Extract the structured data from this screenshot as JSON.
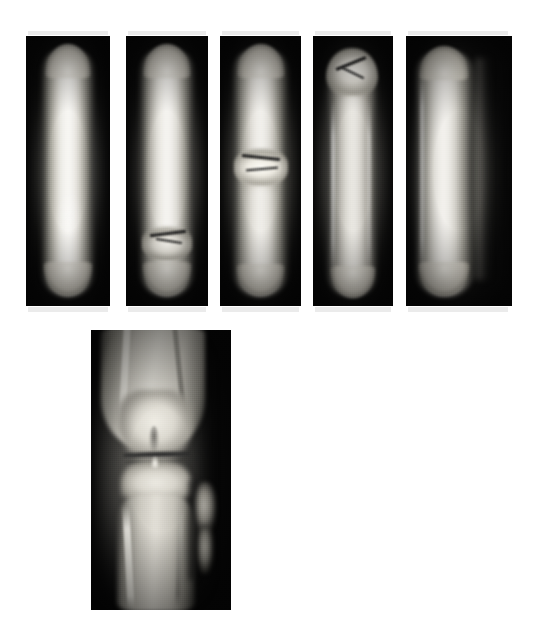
{
  "figure": {
    "kind": "radiograph-figure",
    "background_color": "#ffffff",
    "width": 547,
    "height": 630,
    "caption": "",
    "panel_count": 6
  },
  "series": {
    "label": "",
    "description": "Serial anteroposterior radiographs of a long bone (femoral / tibial diaphysis) showing progressive fracture healing, followed by an anteroposterior radiograph of the knee.",
    "row_top_label": "",
    "row_bottom_label": ""
  },
  "panels": [
    {
      "id": "panel-1",
      "label": "",
      "position": {
        "x": 26,
        "y": 36,
        "w": 84,
        "h": 270
      },
      "film_color": "#0a0a0a",
      "bone_color": "#e8e6e0",
      "view": "long-bone-ap",
      "finding": "intact diaphysis, no visible fracture line",
      "fracture": null
    },
    {
      "id": "panel-2",
      "label": "",
      "position": {
        "x": 126,
        "y": 36,
        "w": 82,
        "h": 270
      },
      "film_color": "#0a0a0a",
      "bone_color": "#e6e4de",
      "view": "long-bone-ap",
      "finding": "transverse fracture with early callus, distal third",
      "fracture": {
        "center_y_pct": 74,
        "type": "transverse"
      }
    },
    {
      "id": "panel-3",
      "label": "",
      "position": {
        "x": 220,
        "y": 36,
        "w": 81,
        "h": 270
      },
      "film_color": "#0a0a0a",
      "bone_color": "#ddd9d2",
      "view": "long-bone-ap",
      "finding": "fracture with callus formation at mid-diaphysis",
      "fracture": {
        "center_y_pct": 46,
        "type": "transverse"
      }
    },
    {
      "id": "panel-4",
      "label": "",
      "position": {
        "x": 313,
        "y": 36,
        "w": 80,
        "h": 270
      },
      "film_color": "#0a0a0a",
      "bone_color": "#d9d5ce",
      "view": "long-bone-ap",
      "finding": "fracture with bridging callus, proximal third",
      "fracture": {
        "center_y_pct": 17,
        "type": "oblique"
      }
    },
    {
      "id": "panel-5",
      "label": "",
      "position": {
        "x": 406,
        "y": 36,
        "w": 106,
        "h": 270
      },
      "film_color": "#0a0a0a",
      "bone_color": "#dad6cf",
      "view": "long-bone-ap",
      "finding": "remodelled, united diaphysis",
      "fracture": null
    },
    {
      "id": "panel-6",
      "label": "",
      "position": {
        "x": 91,
        "y": 330,
        "w": 140,
        "h": 280
      },
      "film_color": "#070707",
      "bone_color": "#ebe9e3",
      "view": "knee-ap",
      "finding": "anteroposterior knee: distal femur, femoral condyles, joint space, tibial plateau, proximal tibia and fibula",
      "fracture": null
    }
  ],
  "annotations": {
    "arrows": [],
    "text_labels": [],
    "scale_bar": null
  }
}
